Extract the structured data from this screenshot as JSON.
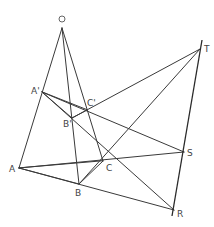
{
  "figure": {
    "colors": {
      "line": "#3a3a3a",
      "label": "#444444",
      "background": "#ffffff"
    },
    "points": {
      "O": {
        "label": "O",
        "x": 62,
        "y": 28
      },
      "A1": {
        "label": "A'",
        "x": 42,
        "y": 92
      },
      "B1": {
        "label": "B'",
        "x": 72,
        "y": 118
      },
      "C1": {
        "label": "C'",
        "x": 87,
        "y": 110
      },
      "A": {
        "label": "A",
        "x": 19,
        "y": 168
      },
      "B": {
        "label": "B",
        "x": 79,
        "y": 184
      },
      "C": {
        "label": "C",
        "x": 103,
        "y": 161
      },
      "T": {
        "label": "T",
        "x": 200,
        "y": 49
      },
      "S": {
        "label": "S",
        "x": 184,
        "y": 152
      },
      "R": {
        "label": "R",
        "x": 174,
        "y": 210
      }
    },
    "labels": {
      "O": "O",
      "A1": "A'",
      "B1": "B'",
      "C1": "C'",
      "A": "A",
      "B": "B",
      "C": "C",
      "T": "T",
      "S": "S",
      "R": "R"
    }
  }
}
